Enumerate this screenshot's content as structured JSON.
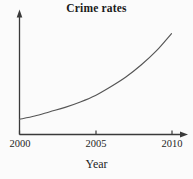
{
  "chart_data": {
    "type": "line",
    "title": "Crime rates",
    "xlabel": "Year",
    "ylabel": "",
    "x_tick_labels": [
      "2000",
      "2005",
      "2010"
    ],
    "x_ticks": [
      2000,
      2005,
      2010
    ],
    "xlim": [
      2000,
      2010
    ],
    "y_tick_labels": [],
    "ylim": [
      0,
      100
    ],
    "grid": false,
    "legend": null,
    "annotations": [],
    "series": [
      {
        "name": "Crime rates",
        "x": [
          2000,
          2001,
          2002,
          2003,
          2004,
          2005,
          2006,
          2007,
          2008,
          2009,
          2010
        ],
        "values": [
          14,
          17,
          21,
          25,
          30,
          36,
          44,
          53,
          64,
          77,
          93
        ],
        "color": "#555555"
      }
    ],
    "axis_style": {
      "x_axis_arrow": true,
      "y_axis_arrow": true,
      "axis_color": "#3a3a3a",
      "curve_color": "#555555",
      "background": "#fbfbfb"
    }
  },
  "figure": {
    "title": "Crime rates",
    "xaxis_label": "Year",
    "tick_labels": [
      "2000",
      "2005",
      "2010"
    ]
  }
}
